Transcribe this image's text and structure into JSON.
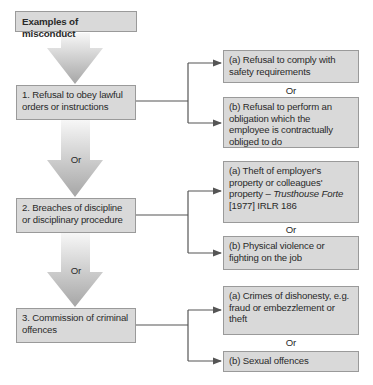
{
  "header": {
    "title": "Examples of misconduct"
  },
  "sections": [
    {
      "label": "1. Refusal to obey lawful orders or instructions",
      "options": [
        {
          "text": "(a) Refusal to comply with safety requirements"
        },
        {
          "text": "(b) Refusal to perform an obligation which the employee is contractually obliged to do"
        }
      ],
      "separator": "Or"
    },
    {
      "label": "2. Breaches of discipline or disciplinary procedure",
      "options": [
        {
          "text_prefix": "(a) Theft of employer's property or colleagues' property – ",
          "case_name": "Trusthouse Forte",
          "citation": " [1977] IRLR 186"
        },
        {
          "text": "(b) Physical violence or fighting on the job"
        }
      ],
      "separator": "Or"
    },
    {
      "label": "3. Commission of criminal offences",
      "options": [
        {
          "text": "(a) Crimes of dishonesty, e.g. fraud or embezzlement or theft"
        },
        {
          "text": "(b) Sexual offences"
        }
      ],
      "separator": "Or"
    }
  ],
  "main_arrows": [
    {
      "label": ""
    },
    {
      "label": "Or"
    },
    {
      "label": "Or"
    }
  ],
  "colors": {
    "box_fill": "#d9d9d9",
    "box_border": "#9a9a9a",
    "connector": "#555555",
    "arrow_top": "#f5f5f5",
    "arrow_bottom": "#a8a8a8"
  }
}
